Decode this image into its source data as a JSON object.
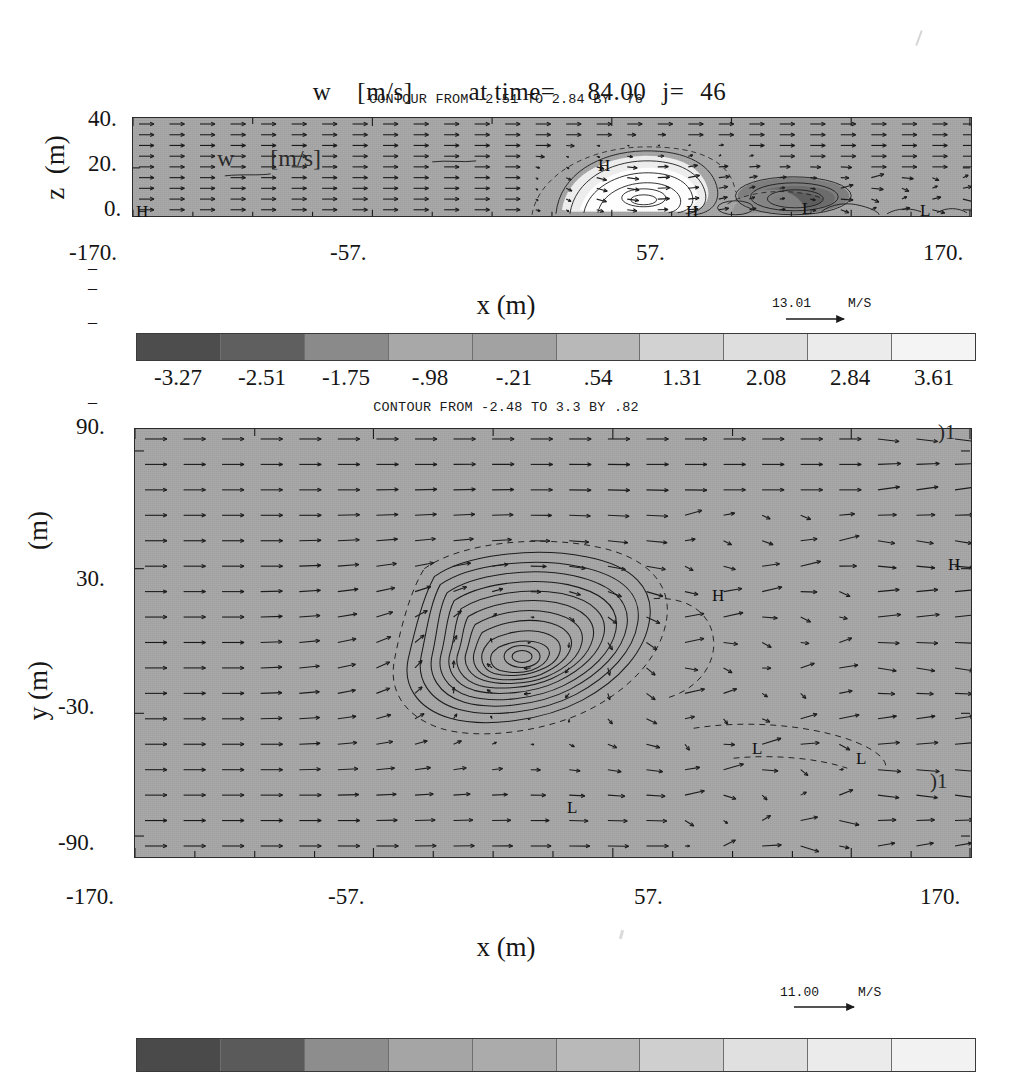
{
  "figure": {
    "title": {
      "variable": "w",
      "units": "[m/s]",
      "time_label": "at time=",
      "time_value": "84.00",
      "index_label": "j=",
      "index_value": "46"
    },
    "background_color": "#ffffff",
    "field_fill_color": "#a6a6a6",
    "line_color": "#1c1c1c"
  },
  "panels": [
    {
      "id": "xz-panel",
      "contour_note": "CONTOUR FROM -2.51 TO 2.84 BY  76",
      "xlabel": "x (m)",
      "ylabel": "z  (m)",
      "ylabel_unit": "(m)",
      "xticks": [
        "-170.",
        "-57.",
        "57.",
        "170."
      ],
      "yticks": [
        "40.",
        "20.",
        "0."
      ],
      "ghost_text": "w      [m/s]",
      "extrema": [
        {
          "label": "H",
          "x_frac": 0.012,
          "y_frac": 0.93
        },
        {
          "label": "H",
          "x_frac": 0.555,
          "y_frac": 0.48
        },
        {
          "label": "H",
          "x_frac": 0.668,
          "y_frac": 0.93
        },
        {
          "label": "L",
          "x_frac": 0.812,
          "y_frac": 0.9
        },
        {
          "label": "L",
          "x_frac": 0.952,
          "y_frac": 0.92
        }
      ],
      "vector_key": {
        "value": "13.01",
        "unit": "M/S"
      }
    },
    {
      "id": "xy-panel",
      "contour_note": "CONTOUR FROM -2.48 TO 3.3 BY .82",
      "xlabel": "x (m)",
      "ylabel": "y (m)",
      "ylabel_unit": "(m)",
      "xticks": [
        "-170.",
        "-57.",
        "57.",
        "170."
      ],
      "yticks": [
        "90.",
        "30.",
        "-30.",
        "-90."
      ],
      "edge_labels": [
        "01",
        "01"
      ],
      "extrema": [
        {
          "label": "H",
          "x_frac": 0.695,
          "y_frac": 0.375
        },
        {
          "label": "H",
          "x_frac": 0.977,
          "y_frac": 0.305
        },
        {
          "label": "L",
          "x_frac": 0.566,
          "y_frac": 0.855
        },
        {
          "label": "L",
          "x_frac": 0.775,
          "y_frac": 0.755
        },
        {
          "label": "L",
          "x_frac": 0.885,
          "y_frac": 0.775
        }
      ],
      "vector_key": {
        "value": "11.00",
        "unit": "M/S"
      }
    }
  ],
  "colorbars": [
    {
      "id": "colorbar-top",
      "labels": [
        "-3.27",
        "-2.51",
        "-1.75",
        "-.98",
        "-.21",
        ".54",
        "1.31",
        "2.08",
        "2.84",
        "3.61"
      ],
      "swatches": [
        "#4d4d4d",
        "#5f5f5f",
        "#8a8a8a",
        "#a8a8a8",
        "#a2a2a2",
        "#b8b8b8",
        "#d2d2d2",
        "#dedede",
        "#ebebeb",
        "#f4f4f4"
      ]
    },
    {
      "id": "colorbar-bottom",
      "labels": [],
      "swatches": [
        "#4a4a4a",
        "#5a5a5a",
        "#8d8d8d",
        "#a5a5a5",
        "#ababab",
        "#b9b9b9",
        "#cfcfcf",
        "#e0e0e0",
        "#ebebeb",
        "#f2f2f2"
      ]
    }
  ],
  "chart_data": {
    "type": "heatmap",
    "subtitle": "Shaded contour + wind-vector overlay, two orthogonal cross-sections",
    "panels": [
      {
        "name": "vertical cross-section (x-z) at j=46",
        "xlabel": "x (m)",
        "ylabel": "z (m)",
        "xlim": [
          -170,
          170
        ],
        "ylim": [
          0,
          40
        ],
        "xticks": [
          -170,
          -57,
          57,
          170
        ],
        "yticks": [
          0,
          20,
          40
        ],
        "contour_from": -2.51,
        "contour_to": 2.84,
        "contour_by": 0.76,
        "vector_reference_magnitude": 13.01,
        "vector_reference_unit": "M/S",
        "grid": false,
        "legend": "none",
        "features": [
          {
            "type": "high",
            "label": "H",
            "x": -167,
            "z": 1
          },
          {
            "type": "high",
            "label": "H",
            "x": 19,
            "z": 21
          },
          {
            "type": "high",
            "label": "H",
            "x": 57,
            "z": 1
          },
          {
            "type": "low",
            "label": "L",
            "x": 106,
            "z": 2
          },
          {
            "type": "low",
            "label": "L",
            "x": 154,
            "z": 1
          }
        ]
      },
      {
        "name": "horizontal cross-section (x-y)",
        "xlabel": "x (m)",
        "ylabel": "y (m)",
        "xlim": [
          -170,
          170
        ],
        "ylim": [
          -90,
          90
        ],
        "xticks": [
          -170,
          -57,
          57,
          170
        ],
        "yticks": [
          -90,
          -30,
          30,
          90
        ],
        "contour_from": -2.48,
        "contour_to": 3.3,
        "contour_by": 0.82,
        "vector_reference_magnitude": 11.0,
        "vector_reference_unit": "M/S",
        "grid": false,
        "legend": "none",
        "features": [
          {
            "type": "high",
            "label": "H",
            "x": 63,
            "y": 23
          },
          {
            "type": "high",
            "label": "H",
            "x": 162,
            "y": 35
          },
          {
            "type": "low",
            "label": "L",
            "x": 21,
            "y": -64
          },
          {
            "type": "low",
            "label": "L",
            "x": 101,
            "y": -46
          },
          {
            "type": "low",
            "label": "L",
            "x": 148,
            "y": -50
          }
        ]
      }
    ],
    "colorbar": {
      "orientation": "horizontal",
      "tick_labels": [
        "-3.27",
        "-2.51",
        "-1.75",
        "-.98",
        "-.21",
        ".54",
        "1.31",
        "2.08",
        "2.84",
        "3.61"
      ],
      "values": [
        -3.27,
        -2.51,
        -1.75,
        -0.98,
        -0.21,
        0.54,
        1.31,
        2.08,
        2.84,
        3.61
      ],
      "colormap": "grayscale (dark=negative, light=positive)"
    }
  }
}
